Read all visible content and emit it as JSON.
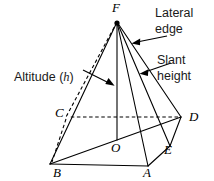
{
  "figure": {
    "type": "geometric-diagram",
    "shape": "square pyramid",
    "background_color": "#ffffff",
    "line_color": "#000000"
  },
  "vertices": [
    {
      "id": "F",
      "label": "F",
      "role": "apex",
      "x": 117,
      "y": 22,
      "label_x": 112,
      "label_y": 12
    },
    {
      "id": "C",
      "label": "C",
      "role": "base-corner",
      "x": 66,
      "y": 117,
      "label_x": 55,
      "label_y": 117
    },
    {
      "id": "D",
      "label": "D",
      "role": "base-corner",
      "x": 181,
      "y": 117,
      "label_x": 189,
      "label_y": 121
    },
    {
      "id": "E",
      "label": "E",
      "role": "base-corner",
      "x": 170,
      "y": 146,
      "label_x": 164,
      "label_y": 154
    },
    {
      "id": "A",
      "label": "A",
      "role": "base-corner",
      "x": 148,
      "y": 166,
      "label_x": 143,
      "label_y": 177
    },
    {
      "id": "B",
      "label": "B",
      "role": "base-corner",
      "x": 50,
      "y": 164,
      "label_x": 53,
      "label_y": 177
    },
    {
      "id": "O",
      "label": "O",
      "role": "base-center",
      "x": 117,
      "y": 140,
      "label_x": 111,
      "label_y": 152
    }
  ],
  "callouts": [
    {
      "name": "lateral-edge",
      "lines": [
        "Lateral",
        "edge"
      ],
      "text_x": 155,
      "text_y_first": 17,
      "text_y_second": 33,
      "arrow_from_x": 167,
      "arrow_from_y": 36,
      "arrow_to_x": 133,
      "arrow_to_y": 43
    },
    {
      "name": "slant-height",
      "lines": [
        "Slant",
        "height"
      ],
      "text_x": 157,
      "text_y_first": 64,
      "text_y_second": 80,
      "arrow_from_x": 171,
      "arrow_from_y": 63,
      "arrow_to_x": 141,
      "arrow_to_y": 73
    },
    {
      "name": "altitude",
      "lines": [
        "Altitude (h)"
      ],
      "text_prefix": "Altitude (",
      "text_var": "h",
      "text_suffix": ")",
      "text_x": 14,
      "text_y_first": 81,
      "arrow_from_x": 83,
      "arrow_from_y": 70,
      "arrow_to_x": 113,
      "arrow_to_y": 85
    }
  ],
  "edges": [
    {
      "name": "apex-to-B",
      "from": "F",
      "to": "B",
      "style": "solid"
    },
    {
      "name": "apex-to-A",
      "from": "F",
      "to": "A",
      "style": "solid"
    },
    {
      "name": "apex-to-E",
      "from": "F",
      "to": "E",
      "style": "solid"
    },
    {
      "name": "apex-to-D",
      "from": "F",
      "to": "D",
      "style": "solid"
    },
    {
      "name": "apex-to-C",
      "from": "F",
      "to": "C",
      "style": "dashed"
    },
    {
      "name": "altitude-line",
      "from": "F",
      "to": "O",
      "style": "solid"
    },
    {
      "name": "base-B-to-A",
      "from": "B",
      "to": "A",
      "style": "solid"
    },
    {
      "name": "base-A-to-E",
      "from": "A",
      "to": "E",
      "style": "solid"
    },
    {
      "name": "base-E-to-D",
      "from": "E",
      "to": "D",
      "style": "solid"
    },
    {
      "name": "base-D-to-C",
      "from": "D",
      "to": "C",
      "style": "dashed"
    },
    {
      "name": "base-C-to-B",
      "from": "C",
      "to": "B",
      "style": "dashed"
    },
    {
      "name": "base-B-to-D",
      "from": "B",
      "to": "D",
      "style": "solid"
    }
  ]
}
